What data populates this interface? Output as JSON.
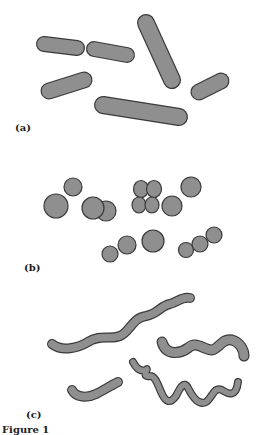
{
  "figure": {
    "fill_color": "#8f8f8f",
    "stroke_color": "#3a3a3a",
    "panels": [
      {
        "label": "(a)",
        "name": "bacilli",
        "shape": "rod"
      },
      {
        "label": "(b)",
        "name": "cocci",
        "shape": "sphere"
      },
      {
        "label": "(c)",
        "name": "spirilla",
        "shape": "spiral"
      }
    ],
    "caption": "Figure 1"
  }
}
